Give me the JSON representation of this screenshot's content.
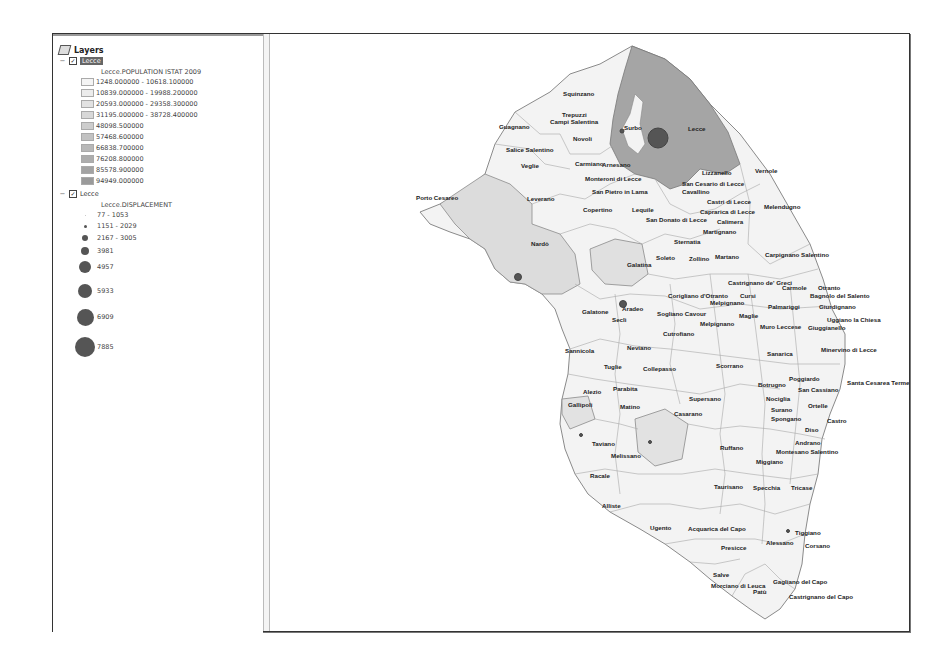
{
  "toc": {
    "title": "Layers",
    "layers": [
      {
        "name": "Lecce",
        "checked": true,
        "selected": true,
        "field": "Lecce.POPULATION ISTAT 2009",
        "classes": [
          {
            "label": "1248.000000 - 10618.100000",
            "color": "#f4f4f4"
          },
          {
            "label": "10839.000000 - 19988.200000",
            "color": "#ececec"
          },
          {
            "label": "20593.000000 - 29358.300000",
            "color": "#e2e2e2"
          },
          {
            "label": "31195.000000 - 38728.400000",
            "color": "#d8d8d8"
          },
          {
            "label": "48098.500000",
            "color": "#cdcdcd"
          },
          {
            "label": "57468.600000",
            "color": "#c2c2c2"
          },
          {
            "label": "66838.700000",
            "color": "#b8b8b8"
          },
          {
            "label": "76208.800000",
            "color": "#adadad"
          },
          {
            "label": "85578.900000",
            "color": "#a3a3a3"
          },
          {
            "label": "94949.000000",
            "color": "#9a9a9a"
          }
        ]
      },
      {
        "name": "Lecce",
        "checked": true,
        "selected": false,
        "field": "Lecce.DISPLACEMENT",
        "classes": [
          {
            "label": "77 - 1053",
            "size": 1
          },
          {
            "label": "1151 - 2029",
            "size": 3
          },
          {
            "label": "2167 - 3005",
            "size": 6
          },
          {
            "label": "3981",
            "size": 8
          },
          {
            "label": "4957",
            "size": 12
          },
          {
            "label": "5933",
            "size": 14
          },
          {
            "label": "6909",
            "size": 17
          },
          {
            "label": "7885",
            "size": 20
          }
        ]
      }
    ]
  },
  "map": {
    "labels": [
      {
        "t": "Squinzano",
        "x": 293,
        "y": 62
      },
      {
        "t": "Trepuzzi",
        "x": 292,
        "y": 83
      },
      {
        "t": "Campi Salentina",
        "x": 280,
        "y": 90
      },
      {
        "t": "Surbo",
        "x": 354,
        "y": 96
      },
      {
        "t": "Lecce",
        "x": 418,
        "y": 97
      },
      {
        "t": "Guagnano",
        "x": 229,
        "y": 95
      },
      {
        "t": "Novoli",
        "x": 303,
        "y": 107
      },
      {
        "t": "Salice Salentino",
        "x": 236,
        "y": 118
      },
      {
        "t": "Veglie",
        "x": 251,
        "y": 134
      },
      {
        "t": "Carmiano",
        "x": 305,
        "y": 132
      },
      {
        "t": "Arnesano",
        "x": 332,
        "y": 133
      },
      {
        "t": "Monteroni di Lecce",
        "x": 315,
        "y": 147
      },
      {
        "t": "Lizzanello",
        "x": 432,
        "y": 141
      },
      {
        "t": "Vernole",
        "x": 485,
        "y": 139
      },
      {
        "t": "San Cesario di Lecce",
        "x": 412,
        "y": 152
      },
      {
        "t": "Porto Cesareo",
        "x": 146,
        "y": 166
      },
      {
        "t": "Leverano",
        "x": 257,
        "y": 167
      },
      {
        "t": "San Pietro in Lama",
        "x": 322,
        "y": 160
      },
      {
        "t": "Cavallino",
        "x": 412,
        "y": 160
      },
      {
        "t": "Castri di Lecce",
        "x": 437,
        "y": 170
      },
      {
        "t": "Caprarica di Lecce",
        "x": 430,
        "y": 180
      },
      {
        "t": "Melendugno",
        "x": 494,
        "y": 175
      },
      {
        "t": "Copertino",
        "x": 313,
        "y": 178
      },
      {
        "t": "Lequile",
        "x": 362,
        "y": 178
      },
      {
        "t": "San Donato di Lecce",
        "x": 376,
        "y": 188
      },
      {
        "t": "Calimera",
        "x": 447,
        "y": 190
      },
      {
        "t": "Martignano",
        "x": 433,
        "y": 200
      },
      {
        "t": "Sternatia",
        "x": 404,
        "y": 210
      },
      {
        "t": "Nardò",
        "x": 261,
        "y": 212
      },
      {
        "t": "Galatina",
        "x": 357,
        "y": 233
      },
      {
        "t": "Soleto",
        "x": 386,
        "y": 226
      },
      {
        "t": "Zollino",
        "x": 419,
        "y": 227
      },
      {
        "t": "Martano",
        "x": 445,
        "y": 225
      },
      {
        "t": "Carpignano Salentino",
        "x": 495,
        "y": 223
      },
      {
        "t": "Castrignano de' Greci",
        "x": 458,
        "y": 251
      },
      {
        "t": "Carmole",
        "x": 512,
        "y": 256
      },
      {
        "t": "Otranto",
        "x": 548,
        "y": 256
      },
      {
        "t": "Corigliano d'Otranto",
        "x": 398,
        "y": 264
      },
      {
        "t": "Cursi",
        "x": 470,
        "y": 264
      },
      {
        "t": "Bagnolo del Salento",
        "x": 540,
        "y": 264
      },
      {
        "t": "Melpignano",
        "x": 440,
        "y": 271
      },
      {
        "t": "Palmariggi",
        "x": 498,
        "y": 275
      },
      {
        "t": "Giurdignano",
        "x": 549,
        "y": 275
      },
      {
        "t": "Galatone",
        "x": 312,
        "y": 280
      },
      {
        "t": "Aradeo",
        "x": 352,
        "y": 277
      },
      {
        "t": "Sogliano Cavour",
        "x": 387,
        "y": 282
      },
      {
        "t": "Maglie",
        "x": 469,
        "y": 284
      },
      {
        "t": "Seclì",
        "x": 342,
        "y": 288
      },
      {
        "t": "Melpignano",
        "x": 430,
        "y": 292
      },
      {
        "t": "Uggiano la Chiesa",
        "x": 557,
        "y": 288
      },
      {
        "t": "Muro Leccese",
        "x": 490,
        "y": 295
      },
      {
        "t": "Giuggianello",
        "x": 538,
        "y": 296
      },
      {
        "t": "Cutrofiano",
        "x": 393,
        "y": 302
      },
      {
        "t": "Neviano",
        "x": 357,
        "y": 316
      },
      {
        "t": "Sannicola",
        "x": 295,
        "y": 319
      },
      {
        "t": "Sanarica",
        "x": 497,
        "y": 322
      },
      {
        "t": "Minervino di Lecce",
        "x": 551,
        "y": 318
      },
      {
        "t": "Tuglie",
        "x": 334,
        "y": 335
      },
      {
        "t": "Collepasso",
        "x": 373,
        "y": 337
      },
      {
        "t": "Scorrano",
        "x": 446,
        "y": 334
      },
      {
        "t": "Poggiardo",
        "x": 519,
        "y": 347
      },
      {
        "t": "Santa Cesarea Terme",
        "x": 577,
        "y": 351
      },
      {
        "t": "Botrugno",
        "x": 488,
        "y": 353
      },
      {
        "t": "San Cassiano",
        "x": 528,
        "y": 358
      },
      {
        "t": "Parabita",
        "x": 343,
        "y": 357
      },
      {
        "t": "Alezio",
        "x": 313,
        "y": 360
      },
      {
        "t": "Nociglia",
        "x": 496,
        "y": 367
      },
      {
        "t": "Supersano",
        "x": 419,
        "y": 367
      },
      {
        "t": "Ortelle",
        "x": 538,
        "y": 374
      },
      {
        "t": "Gallipoli",
        "x": 298,
        "y": 373
      },
      {
        "t": "Matino",
        "x": 350,
        "y": 375
      },
      {
        "t": "Surano",
        "x": 501,
        "y": 378
      },
      {
        "t": "Casarano",
        "x": 404,
        "y": 382
      },
      {
        "t": "Spongano",
        "x": 501,
        "y": 387
      },
      {
        "t": "Castro",
        "x": 557,
        "y": 389
      },
      {
        "t": "Diso",
        "x": 535,
        "y": 398
      },
      {
        "t": "Andrano",
        "x": 525,
        "y": 411
      },
      {
        "t": "Taviano",
        "x": 322,
        "y": 412
      },
      {
        "t": "Ruffano",
        "x": 450,
        "y": 416
      },
      {
        "t": "Montesano Salentino",
        "x": 506,
        "y": 420
      },
      {
        "t": "Melissano",
        "x": 341,
        "y": 424
      },
      {
        "t": "Miggiano",
        "x": 486,
        "y": 430
      },
      {
        "t": "Racale",
        "x": 320,
        "y": 444
      },
      {
        "t": "Taurisano",
        "x": 444,
        "y": 455
      },
      {
        "t": "Specchia",
        "x": 483,
        "y": 456
      },
      {
        "t": "Tricase",
        "x": 521,
        "y": 456
      },
      {
        "t": "Alliste",
        "x": 332,
        "y": 474
      },
      {
        "t": "Ugento",
        "x": 380,
        "y": 496
      },
      {
        "t": "Acquarica del Capo",
        "x": 418,
        "y": 497
      },
      {
        "t": "Tiggiano",
        "x": 525,
        "y": 501
      },
      {
        "t": "Alessano",
        "x": 496,
        "y": 511
      },
      {
        "t": "Corsano",
        "x": 535,
        "y": 514
      },
      {
        "t": "Presicce",
        "x": 451,
        "y": 516
      },
      {
        "t": "Salve",
        "x": 443,
        "y": 543
      },
      {
        "t": "Gagliano del Capo",
        "x": 503,
        "y": 550
      },
      {
        "t": "Morciano di Leuca",
        "x": 441,
        "y": 554
      },
      {
        "t": "Patù",
        "x": 483,
        "y": 560
      },
      {
        "t": "Castrignano del Capo",
        "x": 519,
        "y": 565
      }
    ],
    "symbols": [
      {
        "x": 388,
        "y": 104,
        "r": 10
      },
      {
        "x": 352,
        "y": 97,
        "r": 2
      },
      {
        "x": 248,
        "y": 243,
        "r": 3.5
      },
      {
        "x": 353,
        "y": 270,
        "r": 3.5
      },
      {
        "x": 311,
        "y": 401,
        "r": 1.5
      },
      {
        "x": 380,
        "y": 408,
        "r": 1.5
      },
      {
        "x": 518,
        "y": 497,
        "r": 1.5
      }
    ]
  }
}
